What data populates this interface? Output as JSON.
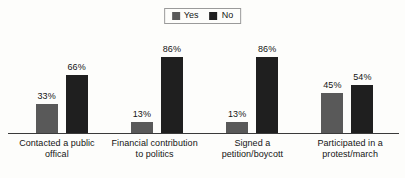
{
  "chart_data": {
    "type": "bar",
    "title": "",
    "subtitle": "",
    "xlabel": "",
    "ylabel": "",
    "ylim": [
      0,
      100
    ],
    "grid": false,
    "legend_position": "top-center",
    "value_suffix": "%",
    "categories": [
      "Contacted a public offical",
      "Financial contribution to politics",
      "Signed a petition/boycott",
      "Participated in a protest/march"
    ],
    "series": [
      {
        "name": "Yes",
        "color": "#595959",
        "values": [
          33,
          13,
          13,
          45
        ],
        "labels": [
          "33%",
          "13%",
          "13%",
          "45%"
        ]
      },
      {
        "name": "No",
        "color": "#1f1f1f",
        "values": [
          66,
          86,
          86,
          54
        ],
        "labels": [
          "66%",
          "86%",
          "86%",
          "54%"
        ]
      }
    ]
  },
  "legend": {
    "items": [
      {
        "label": "Yes",
        "color": "#595959"
      },
      {
        "label": "No",
        "color": "#1f1f1f"
      }
    ]
  },
  "axis": {
    "baseline_color": "#3a3a3a"
  },
  "groups": [
    {
      "category_line1": "Contacted a public",
      "category_line2": "offical",
      "bars": [
        {
          "series": "Yes",
          "label": "33%",
          "value": 33,
          "color": "#595959"
        },
        {
          "series": "No",
          "label": "66%",
          "value": 66,
          "color": "#1f1f1f"
        }
      ]
    },
    {
      "category_line1": "Financial contribution",
      "category_line2": "to politics",
      "bars": [
        {
          "series": "Yes",
          "label": "13%",
          "value": 13,
          "color": "#595959"
        },
        {
          "series": "No",
          "label": "86%",
          "value": 86,
          "color": "#1f1f1f"
        }
      ]
    },
    {
      "category_line1": "Signed a",
      "category_line2": "petition/boycott",
      "bars": [
        {
          "series": "Yes",
          "label": "13%",
          "value": 13,
          "color": "#595959"
        },
        {
          "series": "No",
          "label": "86%",
          "value": 86,
          "color": "#1f1f1f"
        }
      ]
    },
    {
      "category_line1": "Participated in a",
      "category_line2": "protest/march",
      "bars": [
        {
          "series": "Yes",
          "label": "45%",
          "value": 45,
          "color": "#595959"
        },
        {
          "series": "No",
          "label": "54%",
          "value": 54,
          "color": "#1f1f1f"
        }
      ]
    }
  ]
}
